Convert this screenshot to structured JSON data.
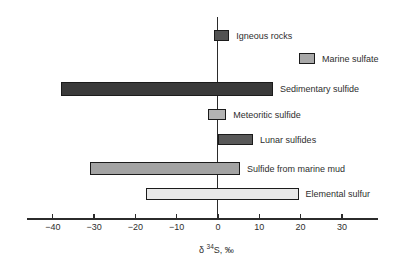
{
  "axis": {
    "title_delta": "δ",
    "title_isotope": "34",
    "title_rest": "S, ‰",
    "tick_labels": [
      "−40",
      "−30",
      "−20",
      "−10",
      "0",
      "10",
      "20",
      "30"
    ]
  },
  "chart_data": {
    "type": "bar",
    "subtype": "horizontal-range-bars",
    "title": "",
    "xlabel": "δ ³⁴S, ‰",
    "xlim": [
      -45,
      37
    ],
    "x_ticks": [
      -40,
      -30,
      -20,
      -10,
      0,
      10,
      20,
      30
    ],
    "grid": false,
    "zero_reference_line": true,
    "series": [
      {
        "name": "Igneous rocks",
        "range": [
          -1,
          2.7
        ],
        "color": "#525252"
      },
      {
        "name": "Marine sulfate",
        "range": [
          19.5,
          23.5
        ],
        "color": "#a8a8a8"
      },
      {
        "name": "Sedimentary sulfide",
        "range": [
          -38,
          13.3
        ],
        "color": "#3a3a3a"
      },
      {
        "name": "Meteoritic sulfide",
        "range": [
          -2.5,
          2
        ],
        "color": "#b3b3b3"
      },
      {
        "name": "Lunar sulfides",
        "range": [
          0,
          8.5
        ],
        "color": "#585858"
      },
      {
        "name": "Sulfide from marine mud",
        "range": [
          -31,
          5.3
        ],
        "color": "#a3a3a3"
      },
      {
        "name": "Elemental sulfur",
        "range": [
          -17.5,
          19.5
        ],
        "color": "#e8e8e8"
      }
    ]
  }
}
